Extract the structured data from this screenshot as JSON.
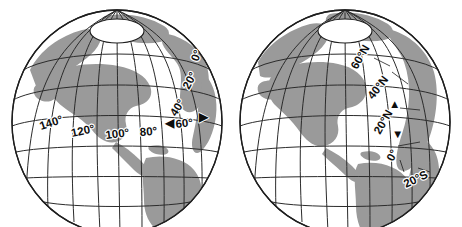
{
  "figure": {
    "background_color": "#ffffff",
    "land_color": "#9a9a9a",
    "ocean_color": "#ffffff",
    "line_color": "#2b2b2b",
    "text_color": "#0d0d0d"
  },
  "globes": [
    {
      "id": "left-globe",
      "name": "longitude-globe",
      "caption": "",
      "measure": "longitude",
      "pole_label": "",
      "arrow": {
        "name": "longitude-span-arrow",
        "direction": "horizontal",
        "left_glyph": "◀",
        "right_glyph": "▶",
        "center_label": "60°"
      },
      "labels": [
        {
          "text": "140°",
          "rotation": -18
        },
        {
          "text": "120°",
          "rotation": -12
        },
        {
          "text": "100°",
          "rotation": -6
        },
        {
          "text": "80°",
          "rotation": 0
        },
        {
          "text": "60°",
          "rotation": 0
        },
        {
          "text": "40°",
          "rotation": -58
        },
        {
          "text": "20°",
          "rotation": -64
        },
        {
          "text": "0°",
          "rotation": -72
        }
      ]
    },
    {
      "id": "right-globe",
      "name": "latitude-globe",
      "caption": "",
      "measure": "latitude",
      "pole_label": "",
      "arrow": {
        "name": "latitude-span-arrow",
        "direction": "vertical",
        "up_glyph": "▲",
        "down_glyph": "▼",
        "center_label": "20°N"
      },
      "labels": [
        {
          "text": "60°N",
          "rotation": -62
        },
        {
          "text": "40°N",
          "rotation": -52
        },
        {
          "text": "20°N",
          "rotation": -62
        },
        {
          "text": "0°",
          "rotation": -64
        },
        {
          "text": "20°S",
          "rotation": -30
        }
      ]
    }
  ]
}
